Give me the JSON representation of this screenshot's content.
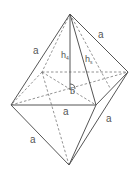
{
  "figure": {
    "type": "octahedron",
    "vertices": {
      "top": [
        70,
        14
      ],
      "back_left": [
        42,
        72
      ],
      "back_right": [
        128,
        72
      ],
      "front_left": [
        11,
        105
      ],
      "front_right": [
        96,
        105
      ],
      "center": [
        70,
        90
      ],
      "bottom": [
        69,
        165
      ]
    },
    "labels": {
      "edge_top_left": "a",
      "edge_top_right": "a",
      "edge_front_base": "a",
      "edge_bottom_left": "a",
      "edge_bottom_right": "a",
      "height_main": "h",
      "height_main_sub": "4",
      "height_slant": "h",
      "height_slant_sub": "s",
      "center_point": "b"
    }
  }
}
